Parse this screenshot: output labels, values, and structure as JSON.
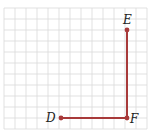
{
  "diagram": {
    "type": "grid-diagram",
    "grid": {
      "cols": 13,
      "rows": 11,
      "cell_size": 11,
      "origin_x": 4,
      "origin_y": 8,
      "line_color": "#d9d9d9"
    },
    "segment_color": "#a83a3a",
    "points": [
      {
        "label": "D",
        "x": 61,
        "y": 118
      },
      {
        "label": "F",
        "x": 127,
        "y": 118
      },
      {
        "label": "E",
        "x": 127,
        "y": 30
      }
    ],
    "segments": [
      {
        "from": "D",
        "to": "F"
      },
      {
        "from": "F",
        "to": "E"
      }
    ],
    "labels": {
      "D": "D",
      "E": "E",
      "F": "F"
    }
  }
}
